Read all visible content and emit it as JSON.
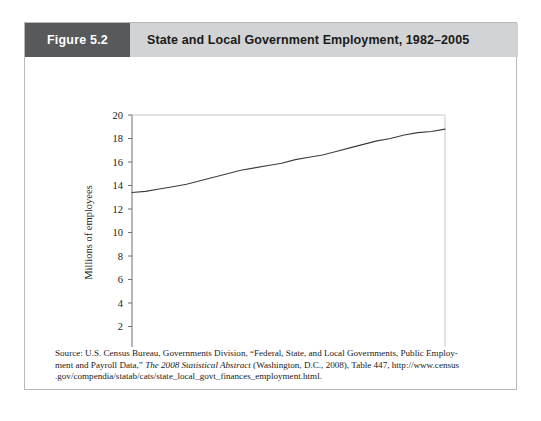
{
  "figure": {
    "tag": "Figure 5.2",
    "title": "State and Local Government Employment, 1982–2005"
  },
  "colors": {
    "tag_bg": "#58595b",
    "title_bg": "#d2d3d5",
    "card_border": "#b9b9b9",
    "axis": "#6f6f6f",
    "line": "#3c3c3c",
    "text": "#1a1a1a"
  },
  "source": {
    "line1_a": "Source: U.S. Census Bureau, Governments Division, “Federal, State, and Local Governments, Public Employ-",
    "line2_a": "ment and Payroll Data,” ",
    "line2_italic": "The 2008 Statistical Abstract",
    "line2_b": " (Washington, D.C., 2008), Table 447, http://www.census",
    "line3_a": ".gov/compendia/statab/cats/state_local_govt_finances_employment.html."
  },
  "chart_data": {
    "type": "line",
    "title": "State and Local Government Employment, 1982–2005",
    "xlabel": "",
    "ylabel": "Millions of employees",
    "xlim": [
      1982,
      2005
    ],
    "ylim": [
      0,
      20
    ],
    "ytick_step": 2,
    "yticks": [
      0,
      2,
      4,
      6,
      8,
      10,
      12,
      14,
      16,
      18,
      20
    ],
    "ytick_labels": [
      "0",
      "2",
      "4",
      "6",
      "8",
      "10",
      "12",
      "14",
      "16",
      "18",
      "20"
    ],
    "xticks": [
      1982,
      1987,
      1992,
      1997,
      2002,
      2005
    ],
    "xtick_labels": [
      "1982",
      "1987",
      "1992",
      "1997",
      "2002",
      "2005"
    ],
    "grid": false,
    "legend": "none",
    "series": [
      {
        "name": "State and local government employment",
        "x": [
          1982,
          1983,
          1984,
          1985,
          1986,
          1987,
          1988,
          1989,
          1990,
          1991,
          1992,
          1993,
          1994,
          1995,
          1996,
          1997,
          1998,
          1999,
          2000,
          2001,
          2002,
          2003,
          2004,
          2005
        ],
        "values": [
          13.4,
          13.5,
          13.7,
          13.9,
          14.1,
          14.4,
          14.7,
          15.0,
          15.3,
          15.5,
          15.7,
          15.9,
          16.2,
          16.4,
          16.6,
          16.9,
          17.2,
          17.5,
          17.8,
          18.0,
          18.3,
          18.5,
          18.6,
          18.8
        ]
      }
    ]
  }
}
